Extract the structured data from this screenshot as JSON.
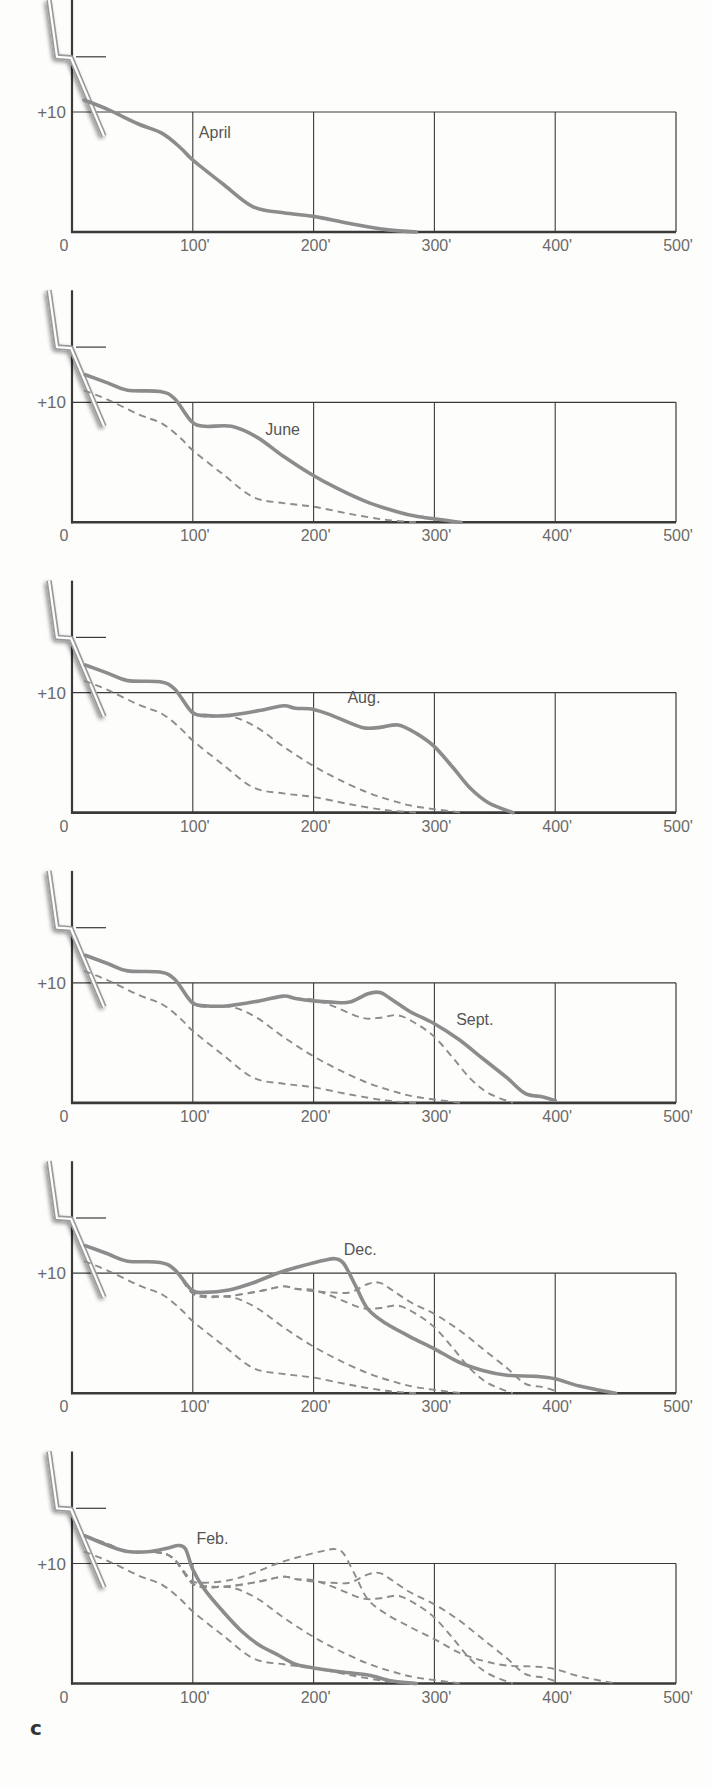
{
  "figure_label": "c",
  "colors": {
    "background": "#fdfdfb",
    "grid": "#3a3a3a",
    "current_curve": "#8c8c8c",
    "previous_curves": "#8c8c8c",
    "tick_text": "#6a6a6a",
    "wall": "#9a9a9a"
  },
  "chart_data": {
    "type": "line",
    "title": "",
    "xlabel": "Distance from shore",
    "ylabel": "Height",
    "x_tick_labels": [
      "0",
      "100'",
      "200'",
      "300'",
      "400'",
      "500'"
    ],
    "x_ticks": [
      0,
      100,
      200,
      300,
      400,
      500
    ],
    "y_tick_labels": [
      "+10"
    ],
    "y_ticks": [
      10
    ],
    "xlim": [
      0,
      500
    ],
    "ylim": [
      0,
      19
    ],
    "grid": true,
    "legend": "none (curves labeled inline)",
    "panels": [
      {
        "label": "April",
        "label_pos": [
          105,
          7.8
        ],
        "series": [
          {
            "name": "April",
            "style": "solid",
            "x": [
              10,
              30,
              55,
              75,
              90,
              100,
              125,
              150,
              175,
              200,
              230,
              260,
              285
            ],
            "y": [
              11,
              10.2,
              9,
              8.2,
              7,
              6,
              4,
              2.1,
              1.6,
              1.3,
              0.7,
              0.2,
              0
            ]
          }
        ]
      },
      {
        "label": "June",
        "label_pos": [
          160,
          7.3
        ],
        "series": [
          {
            "name": "April",
            "style": "dashed",
            "x": [
              10,
              30,
              55,
              75,
              90,
              100,
              125,
              150,
              175,
              200,
              230,
              260,
              285
            ],
            "y": [
              11,
              10.2,
              9,
              8.2,
              7,
              6,
              4,
              2.1,
              1.6,
              1.3,
              0.7,
              0.2,
              0
            ]
          },
          {
            "name": "June",
            "style": "solid",
            "x": [
              11,
              30,
              46,
              73,
              85,
              99,
              110,
              132,
              153,
              175,
              198,
              220,
              244,
              265,
              285,
              322
            ],
            "y": [
              12.3,
              11.6,
              11,
              10.9,
              10.3,
              8.4,
              8,
              8,
              7.1,
              5.5,
              4,
              2.8,
              1.7,
              1,
              0.5,
              0
            ]
          }
        ]
      },
      {
        "label": "Aug.",
        "label_pos": [
          228,
          9.1
        ],
        "series": [
          {
            "name": "April",
            "style": "dashed",
            "x": [
              10,
              30,
              55,
              75,
              90,
              100,
              125,
              150,
              175,
              200,
              230,
              260,
              285
            ],
            "y": [
              11,
              10.2,
              9,
              8.2,
              7,
              6,
              4,
              2.1,
              1.6,
              1.3,
              0.7,
              0.2,
              0
            ]
          },
          {
            "name": "June",
            "style": "dashed",
            "x": [
              11,
              30,
              46,
              73,
              85,
              99,
              110,
              132,
              153,
              175,
              198,
              220,
              244,
              265,
              285,
              322
            ],
            "y": [
              12.3,
              11.6,
              11,
              10.9,
              10.3,
              8.4,
              8,
              8,
              7.1,
              5.5,
              4,
              2.8,
              1.7,
              1,
              0.5,
              0
            ]
          },
          {
            "name": "Aug.",
            "style": "solid",
            "x": [
              11,
              30,
              46,
              73,
              85,
              99,
              110,
              130,
              155,
              175,
              185,
              200,
              215,
              240,
              255,
              270,
              285,
              300,
              315,
              330,
              345,
              365
            ],
            "y": [
              12.3,
              11.6,
              11,
              10.9,
              10.3,
              8.4,
              8.1,
              8.1,
              8.5,
              8.9,
              8.7,
              8.6,
              8.1,
              7.1,
              7.1,
              7.3,
              6.6,
              5.5,
              3.8,
              2,
              0.8,
              0
            ]
          }
        ]
      },
      {
        "label": "Sept.",
        "label_pos": [
          318,
          6.5
        ],
        "series": [
          {
            "name": "April",
            "style": "dashed",
            "x": [
              10,
              30,
              55,
              75,
              90,
              100,
              125,
              150,
              175,
              200,
              230,
              260,
              285
            ],
            "y": [
              11,
              10.2,
              9,
              8.2,
              7,
              6,
              4,
              2.1,
              1.6,
              1.3,
              0.7,
              0.2,
              0
            ]
          },
          {
            "name": "June",
            "style": "dashed",
            "x": [
              11,
              30,
              46,
              73,
              85,
              99,
              110,
              132,
              153,
              175,
              198,
              220,
              244,
              265,
              285,
              322
            ],
            "y": [
              12.3,
              11.6,
              11,
              10.9,
              10.3,
              8.4,
              8,
              8,
              7.1,
              5.5,
              4,
              2.8,
              1.7,
              1,
              0.5,
              0
            ]
          },
          {
            "name": "Aug.",
            "style": "dashed",
            "x": [
              11,
              30,
              46,
              73,
              85,
              99,
              110,
              130,
              155,
              175,
              185,
              200,
              215,
              240,
              255,
              270,
              285,
              300,
              315,
              330,
              345,
              365
            ],
            "y": [
              12.3,
              11.6,
              11,
              10.9,
              10.3,
              8.4,
              8.1,
              8.1,
              8.5,
              8.9,
              8.7,
              8.6,
              8.1,
              7.1,
              7.1,
              7.3,
              6.6,
              5.5,
              3.8,
              2,
              0.8,
              0
            ]
          },
          {
            "name": "Sept.",
            "style": "solid",
            "x": [
              11,
              30,
              46,
              73,
              85,
              99,
              110,
              130,
              155,
              175,
              185,
              200,
              215,
              230,
              245,
              255,
              265,
              280,
              300,
              320,
              340,
              360,
              375,
              390,
              400
            ],
            "y": [
              12.3,
              11.6,
              11,
              10.9,
              10.3,
              8.4,
              8.1,
              8.1,
              8.5,
              8.9,
              8.7,
              8.5,
              8.4,
              8.4,
              9.1,
              9.2,
              8.6,
              7.6,
              6.6,
              5.3,
              3.7,
              2.1,
              0.8,
              0.5,
              0.2
            ]
          }
        ]
      },
      {
        "label": "Dec.",
        "label_pos": [
          225,
          11.5
        ],
        "series": [
          {
            "name": "April",
            "style": "dashed",
            "x": [
              10,
              30,
              55,
              75,
              90,
              100,
              125,
              150,
              175,
              200,
              230,
              260,
              285
            ],
            "y": [
              11,
              10.2,
              9,
              8.2,
              7,
              6,
              4,
              2.1,
              1.6,
              1.3,
              0.7,
              0.2,
              0
            ]
          },
          {
            "name": "June",
            "style": "dashed",
            "x": [
              11,
              30,
              46,
              73,
              85,
              99,
              110,
              132,
              153,
              175,
              198,
              220,
              244,
              265,
              285,
              322
            ],
            "y": [
              12.3,
              11.6,
              11,
              10.9,
              10.3,
              8.4,
              8,
              8,
              7.1,
              5.5,
              4,
              2.8,
              1.7,
              1,
              0.5,
              0
            ]
          },
          {
            "name": "Aug.",
            "style": "dashed",
            "x": [
              11,
              30,
              46,
              73,
              85,
              99,
              110,
              130,
              155,
              175,
              185,
              200,
              215,
              240,
              255,
              270,
              285,
              300,
              315,
              330,
              345,
              365
            ],
            "y": [
              12.3,
              11.6,
              11,
              10.9,
              10.3,
              8.4,
              8.1,
              8.1,
              8.5,
              8.9,
              8.7,
              8.6,
              8.1,
              7.1,
              7.1,
              7.3,
              6.6,
              5.5,
              3.8,
              2,
              0.8,
              0
            ]
          },
          {
            "name": "Sept.",
            "style": "dashed",
            "x": [
              11,
              30,
              46,
              73,
              85,
              99,
              110,
              130,
              155,
              175,
              185,
              200,
              215,
              230,
              245,
              255,
              265,
              280,
              300,
              320,
              340,
              360,
              375,
              390,
              400
            ],
            "y": [
              12.3,
              11.6,
              11,
              10.9,
              10.3,
              8.4,
              8.1,
              8.1,
              8.5,
              8.9,
              8.7,
              8.5,
              8.4,
              8.4,
              9.1,
              9.2,
              8.6,
              7.6,
              6.6,
              5.3,
              3.7,
              2.1,
              0.8,
              0.5,
              0.2
            ]
          },
          {
            "name": "Dec.",
            "style": "solid",
            "x": [
              11,
              30,
              46,
              73,
              85,
              99,
              110,
              130,
              150,
              170,
              190,
              210,
              218,
              225,
              235,
              245,
              260,
              280,
              300,
              320,
              340,
              360,
              385,
              400,
              420,
              450
            ],
            "y": [
              12.3,
              11.6,
              11,
              10.9,
              10.3,
              8.6,
              8.4,
              8.6,
              9.2,
              10,
              10.6,
              11.1,
              11.2,
              10.8,
              8.9,
              7,
              5.8,
              4.7,
              3.7,
              2.6,
              1.9,
              1.5,
              1.4,
              1.2,
              0.6,
              0
            ]
          }
        ]
      },
      {
        "label": "Feb.",
        "label_pos": [
          103,
          11.6
        ],
        "series": [
          {
            "name": "April",
            "style": "dashed",
            "x": [
              10,
              30,
              55,
              75,
              90,
              100,
              125,
              150,
              175,
              200,
              230,
              260,
              285
            ],
            "y": [
              11,
              10.2,
              9,
              8.2,
              7,
              6,
              4,
              2.1,
              1.6,
              1.3,
              0.7,
              0.2,
              0
            ]
          },
          {
            "name": "June",
            "style": "dashed",
            "x": [
              11,
              30,
              46,
              73,
              85,
              99,
              110,
              132,
              153,
              175,
              198,
              220,
              244,
              265,
              285,
              322
            ],
            "y": [
              12.3,
              11.6,
              11,
              10.9,
              10.3,
              8.4,
              8,
              8,
              7.1,
              5.5,
              4,
              2.8,
              1.7,
              1,
              0.5,
              0
            ]
          },
          {
            "name": "Aug.",
            "style": "dashed",
            "x": [
              11,
              30,
              46,
              73,
              85,
              99,
              110,
              130,
              155,
              175,
              185,
              200,
              215,
              240,
              255,
              270,
              285,
              300,
              315,
              330,
              345,
              365
            ],
            "y": [
              12.3,
              11.6,
              11,
              10.9,
              10.3,
              8.4,
              8.1,
              8.1,
              8.5,
              8.9,
              8.7,
              8.6,
              8.1,
              7.1,
              7.1,
              7.3,
              6.6,
              5.5,
              3.8,
              2,
              0.8,
              0
            ]
          },
          {
            "name": "Sept.",
            "style": "dashed",
            "x": [
              11,
              30,
              46,
              73,
              85,
              99,
              110,
              130,
              155,
              175,
              185,
              200,
              215,
              230,
              245,
              255,
              265,
              280,
              300,
              320,
              340,
              360,
              375,
              390,
              400
            ],
            "y": [
              12.3,
              11.6,
              11,
              10.9,
              10.3,
              8.4,
              8.1,
              8.1,
              8.5,
              8.9,
              8.7,
              8.5,
              8.4,
              8.4,
              9.1,
              9.2,
              8.6,
              7.6,
              6.6,
              5.3,
              3.7,
              2.1,
              0.8,
              0.5,
              0.2
            ]
          },
          {
            "name": "Dec.",
            "style": "dashed",
            "x": [
              11,
              30,
              46,
              73,
              85,
              99,
              110,
              130,
              150,
              170,
              190,
              210,
              218,
              225,
              235,
              245,
              260,
              280,
              300,
              320,
              340,
              360,
              385,
              400,
              420,
              450
            ],
            "y": [
              12.3,
              11.6,
              11,
              10.9,
              10.3,
              8.6,
              8.4,
              8.6,
              9.2,
              10,
              10.6,
              11.1,
              11.2,
              10.8,
              8.9,
              7,
              5.8,
              4.7,
              3.7,
              2.6,
              1.9,
              1.5,
              1.4,
              1.2,
              0.6,
              0
            ]
          },
          {
            "name": "Feb.",
            "style": "solid",
            "x": [
              11,
              30,
              46,
              65,
              80,
              88,
              94,
              100,
              110,
              125,
              140,
              155,
              170,
              185,
              200,
              220,
              245,
              265,
              285
            ],
            "y": [
              12.3,
              11.5,
              11,
              11,
              11.3,
              11.5,
              11.2,
              9.5,
              7.8,
              6,
              4.4,
              3.2,
              2.4,
              1.6,
              1.3,
              1,
              0.7,
              0.2,
              0
            ]
          }
        ]
      }
    ]
  }
}
